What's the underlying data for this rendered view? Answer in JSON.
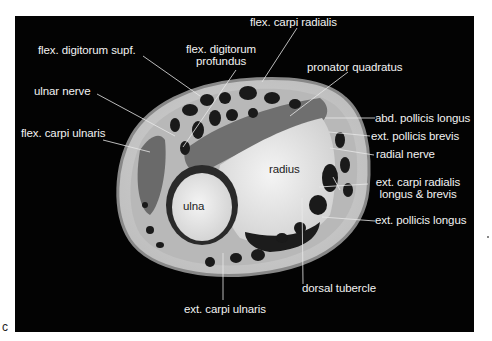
{
  "figure": {
    "panel_letter": "c",
    "background": "#030303",
    "bones": [
      {
        "id": "ulna",
        "label": "ulna"
      },
      {
        "id": "radius",
        "label": "radius"
      }
    ],
    "labels": {
      "flex_carpi_radialis": "flex. carpi radialis",
      "flex_digitorum_supf": "flex. digitorum supf.",
      "flex_digitorum_profundus_1": "flex. digitorum",
      "flex_digitorum_profundus_2": "profundus",
      "ulnar_nerve": "ulnar nerve",
      "pronator_quadratus": "pronator quadratus",
      "flex_carpi_ulnaris": "flex. carpi ulnaris",
      "abd_pollicis_longus": "abd. pollicis longus",
      "ext_pollicis_brevis": "ext. pollicis brevis",
      "radial_nerve": "radial nerve",
      "radius": "radius",
      "ulna": "ulna",
      "ext_carpi_radialis_1": "ext. carpi radialis",
      "ext_carpi_radialis_2": "longus & brevis",
      "ext_pollicis_longus": "ext. pollicis longus",
      "dorsal_tubercle": "dorsal tubercle",
      "ext_carpi_ulnaris": "ext. carpi ulnaris"
    }
  }
}
